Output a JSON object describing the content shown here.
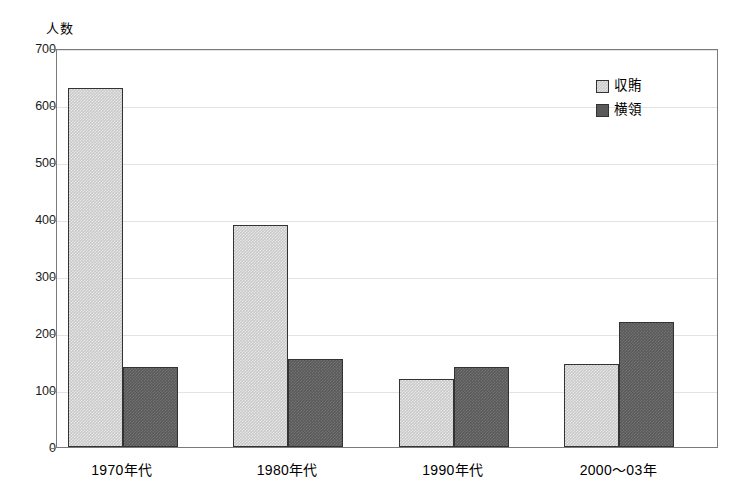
{
  "chart_data": {
    "type": "bar",
    "title": "",
    "xlabel": "",
    "ylabel": "人数",
    "categories": [
      "1970年代",
      "1980年代",
      "1990年代",
      "2000〜03年"
    ],
    "series": [
      {
        "name": "収賄",
        "values": [
          630,
          390,
          120,
          145
        ],
        "color": "#c9c9c9"
      },
      {
        "name": "横領",
        "values": [
          140,
          155,
          140,
          220
        ],
        "color": "#5a5a5a"
      }
    ],
    "ylim": [
      0,
      700
    ],
    "ytick_step": 100,
    "yticks": [
      0,
      100,
      200,
      300,
      400,
      500,
      600,
      700
    ],
    "ytick_labels": [
      "0",
      "100",
      "200",
      "300",
      "400",
      "500",
      "600",
      "700"
    ],
    "grid": true,
    "grid_axis": "y",
    "legend_position": "top-right",
    "frame": true,
    "background_color": "#ffffff",
    "axis_color": "#7a7a7a",
    "grid_color": "#e3e3e3",
    "bar_edge_color": "#333333"
  },
  "legend": {
    "entries": [
      {
        "label": "収賄"
      },
      {
        "label": "横領"
      }
    ]
  }
}
